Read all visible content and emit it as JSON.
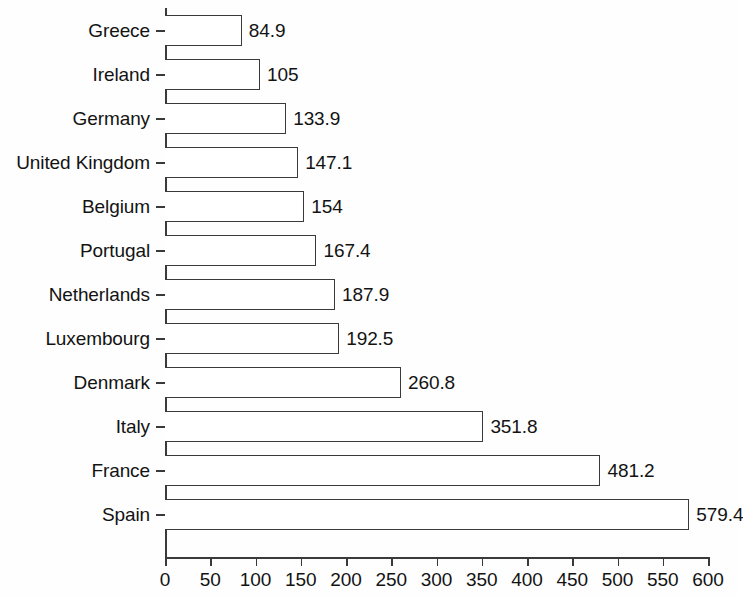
{
  "chart_data": {
    "type": "bar",
    "orientation": "horizontal",
    "title": "",
    "xlabel": "",
    "ylabel": "",
    "xlim": [
      0,
      600
    ],
    "xticks": [
      0,
      50,
      100,
      150,
      200,
      250,
      300,
      350,
      400,
      450,
      500,
      550,
      600
    ],
    "xtick_labels": [
      "0",
      "50",
      "100",
      "150",
      "200",
      "250",
      "300",
      "350",
      "400",
      "450",
      "500",
      "550",
      "600"
    ],
    "grid": false,
    "legend": false,
    "bar_fill_color": "#ffffff",
    "bar_edge_color": "#3a3a3a",
    "categories": [
      "Greece",
      "Ireland",
      "Germany",
      "United Kingdom",
      "Belgium",
      "Portugal",
      "Netherlands",
      "Luxembourg",
      "Denmark",
      "Italy",
      "France",
      "Spain"
    ],
    "values": [
      84.9,
      105,
      133.9,
      147.1,
      154,
      167.4,
      187.9,
      192.5,
      260.8,
      351.8,
      481.2,
      579.4
    ],
    "value_labels": [
      "84.9",
      "105",
      "133.9",
      "147.1",
      "154",
      "167.4",
      "187.9",
      "192.5",
      "260.8",
      "351.8",
      "481.2",
      "579.4"
    ],
    "bars": [
      {
        "category": "Greece",
        "value": 84.9,
        "label": "84.9"
      },
      {
        "category": "Ireland",
        "value": 105,
        "label": "105"
      },
      {
        "category": "Germany",
        "value": 133.9,
        "label": "133.9"
      },
      {
        "category": "United Kingdom",
        "value": 147.1,
        "label": "147.1"
      },
      {
        "category": "Belgium",
        "value": 154,
        "label": "154"
      },
      {
        "category": "Portugal",
        "value": 167.4,
        "label": "167.4"
      },
      {
        "category": "Netherlands",
        "value": 187.9,
        "label": "187.9"
      },
      {
        "category": "Luxembourg",
        "value": 192.5,
        "label": "192.5"
      },
      {
        "category": "Denmark",
        "value": 260.8,
        "label": "260.8"
      },
      {
        "category": "Italy",
        "value": 351.8,
        "label": "351.8"
      },
      {
        "category": "France",
        "value": 481.2,
        "label": "481.2"
      },
      {
        "category": "Spain",
        "value": 579.4,
        "label": "579.4"
      }
    ]
  },
  "layout": {
    "axis_origin_x": 165,
    "axis_baseline_y": 557,
    "px_per_unit": 0.905,
    "first_row_center_y": 30,
    "row_pitch": 44,
    "bar_height": 31,
    "value_label_gap": 7
  }
}
